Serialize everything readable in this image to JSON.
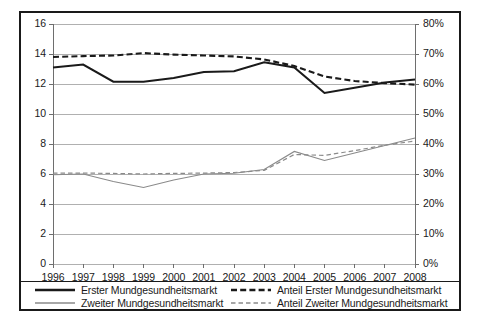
{
  "chart_data": {
    "type": "line",
    "title": "",
    "xlabel": "",
    "ylabel": "",
    "x": [
      1996,
      1997,
      1998,
      1999,
      2000,
      2001,
      2002,
      2003,
      2004,
      2005,
      2006,
      2007,
      2008
    ],
    "xtick_labels": [
      "1996",
      "1997",
      "1998",
      "1999",
      "2000",
      "2001",
      "2002",
      "2003",
      "2004",
      "2005",
      "2006",
      "2007",
      "2008"
    ],
    "left_axis": {
      "ylim": [
        0,
        16
      ],
      "step": 2,
      "tick_labels": [
        "16",
        "14",
        "12",
        "10",
        "8",
        "6",
        "4",
        "2",
        "0"
      ],
      "tick_values": [
        16,
        14,
        12,
        10,
        8,
        6,
        4,
        2,
        0
      ]
    },
    "right_axis": {
      "ylim": [
        0,
        80
      ],
      "step": 10,
      "tick_labels": [
        "80%",
        "70%",
        "60%",
        "50%",
        "40%",
        "30%",
        "20%",
        "10%",
        "0%"
      ],
      "tick_values": [
        80,
        70,
        60,
        50,
        40,
        30,
        20,
        10,
        0
      ]
    },
    "grid": true,
    "legend_position": "bottom",
    "series": [
      {
        "name": "Erster Mundgesundheitsmarkt",
        "axis": "left",
        "style": "solid",
        "color": "#1a1a1a",
        "width": 2.1,
        "values": [
          13.1,
          13.3,
          12.15,
          12.15,
          12.4,
          12.8,
          12.85,
          13.45,
          13.1,
          11.4,
          11.75,
          12.1,
          12.3
        ]
      },
      {
        "name": "Zweiter Mundgesundheitsmarkt",
        "axis": "left",
        "style": "solid",
        "color": "#8a8a8a",
        "width": 1.2,
        "values": [
          5.95,
          6.0,
          5.5,
          5.1,
          5.6,
          6.0,
          6.05,
          6.3,
          7.5,
          6.9,
          7.4,
          7.9,
          8.4
        ]
      },
      {
        "name": "Anteil Erster Mundgesundheitsmarkt",
        "axis": "right",
        "style": "dashed",
        "color": "#1a1a1a",
        "width": 2.1,
        "values": [
          69.0,
          69.3,
          69.5,
          70.3,
          69.8,
          69.5,
          69.2,
          68.2,
          66.0,
          62.5,
          61.0,
          60.3,
          59.8
        ]
      },
      {
        "name": "Anteil Zweiter Mundgesundheitsmarkt",
        "axis": "right",
        "style": "dashed",
        "color": "#8a8a8a",
        "width": 1.2,
        "values": [
          30.3,
          30.3,
          30.2,
          30.0,
          30.2,
          30.3,
          30.5,
          31.2,
          36.5,
          36.2,
          37.8,
          39.6,
          41.0
        ]
      }
    ]
  },
  "legend": {
    "items": [
      {
        "label": "Erster Mundgesundheitsmarkt",
        "style": "solid",
        "color": "#1a1a1a",
        "width": 2.4
      },
      {
        "label": "Zweiter Mundgesundheitsmarkt",
        "style": "solid",
        "color": "#8a8a8a",
        "width": 1.3
      },
      {
        "label": "Anteil Erster Mundgesundheitsmarkt",
        "style": "dashed",
        "color": "#1a1a1a",
        "width": 2.4
      },
      {
        "label": "Anteil Zweiter Mundgesundheitsmarkt",
        "style": "dashed",
        "color": "#8a8a8a",
        "width": 1.3
      }
    ]
  },
  "colors": {
    "frame": "#1a1a1a",
    "grid": "#b0b0b0",
    "axis": "#6e6e6e",
    "background": "#ffffff",
    "series_primary": "#1a1a1a",
    "series_secondary": "#8a8a8a"
  }
}
